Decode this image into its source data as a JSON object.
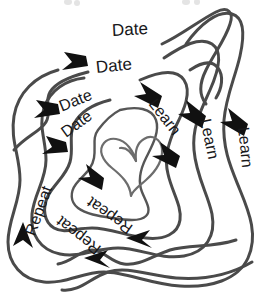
{
  "diagram": {
    "background_color": "#ffffff",
    "stroke_color": "#4a4a4a",
    "arrow_color": "#111111",
    "heart_color": "#6d6d6d",
    "text_color": "#18181a",
    "center_icon": "heart-icon",
    "clipped_top_text": "",
    "labels": [
      {
        "text": "Date",
        "x": 112,
        "y": 31,
        "rotate": -3,
        "size": 17
      },
      {
        "text": "Date",
        "x": 96,
        "y": 68,
        "rotate": -6,
        "size": 17
      },
      {
        "text": "Date",
        "x": 60,
        "y": 107,
        "rotate": -22,
        "size": 16
      },
      {
        "text": "Date",
        "x": 63,
        "y": 134,
        "rotate": -36,
        "size": 16
      },
      {
        "text": "Learn",
        "x": 152,
        "y": 100,
        "rotate": 52,
        "size": 16
      },
      {
        "text": "Learn",
        "x": 205,
        "y": 118,
        "rotate": 78,
        "size": 16
      },
      {
        "text": "Learn",
        "x": 243,
        "y": 126,
        "rotate": 84,
        "size": 16
      },
      {
        "text": "Repeat",
        "x": 30,
        "y": 234,
        "rotate": -70,
        "size": 16
      },
      {
        "text": "Repeat",
        "x": 99,
        "y": 250,
        "rotate": 218,
        "size": 16
      },
      {
        "text": "Repeat",
        "x": 131,
        "y": 229,
        "rotate": 215,
        "size": 16
      }
    ],
    "stages": [
      {
        "name": "date",
        "label": "Date",
        "count": 4
      },
      {
        "name": "learn",
        "label": "Learn",
        "count": 3
      },
      {
        "name": "repeat",
        "label": "Repeat",
        "count": 3
      }
    ]
  }
}
